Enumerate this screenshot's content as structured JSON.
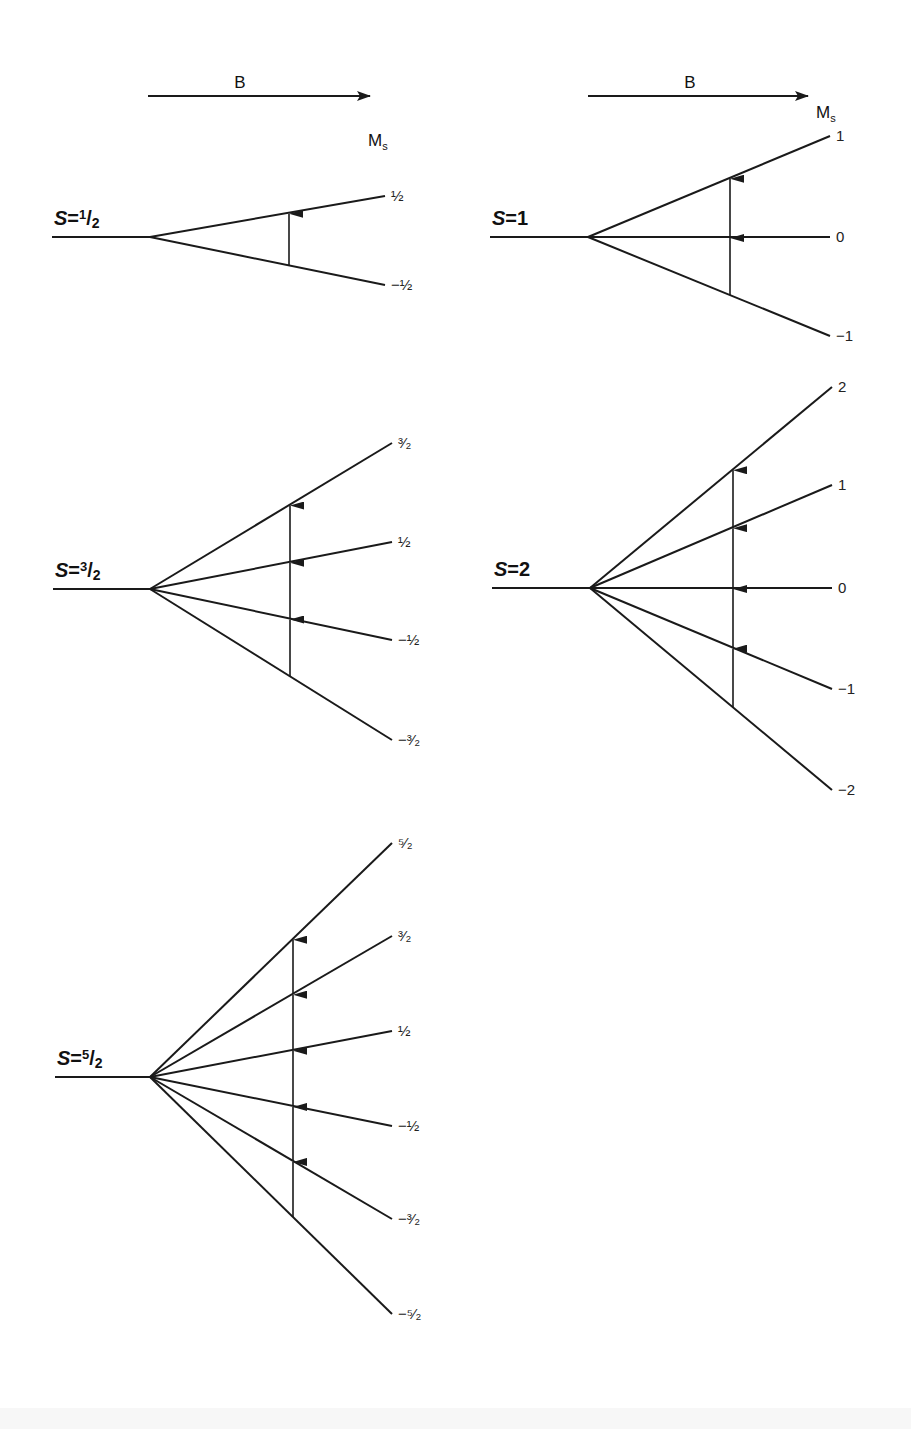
{
  "figure": {
    "field_arrow_label": "B",
    "ms_label": "M",
    "ms_subscript": "s",
    "colors": {
      "ink": "#1a1a1a",
      "background": "#ffffff"
    }
  },
  "panels": [
    {
      "id": "s-half",
      "spin_label": "S=",
      "spin_value": "1/2",
      "spin_sup": "1",
      "spin_sub": "2",
      "base_y": 237,
      "start_x": 52,
      "origin_x": 150,
      "end_x": 385,
      "arrow_x": 289,
      "levels": [
        {
          "ms": "½",
          "end_y": 196
        },
        {
          "ms": "−½",
          "end_y": 285
        }
      ]
    },
    {
      "id": "s-one",
      "spin_label": "S=",
      "spin_value": "1",
      "spin_sup": "",
      "spin_sub": "",
      "base_y": 237,
      "start_x": 490,
      "origin_x": 588,
      "end_x": 830,
      "arrow_x": 730,
      "levels": [
        {
          "ms": "1",
          "end_y": 136
        },
        {
          "ms": "0",
          "end_y": 237
        },
        {
          "ms": "−1",
          "end_y": 336
        }
      ]
    },
    {
      "id": "s-three-halves",
      "spin_label": "S=",
      "spin_value": "3/2",
      "spin_sup": "3",
      "spin_sub": "2",
      "base_y": 589,
      "start_x": 53,
      "origin_x": 150,
      "end_x": 392,
      "arrow_x": 290,
      "levels": [
        {
          "ms": "³⁄₂",
          "end_y": 443
        },
        {
          "ms": "½",
          "end_y": 542
        },
        {
          "ms": "−½",
          "end_y": 640
        },
        {
          "ms": "−³⁄₂",
          "end_y": 740
        }
      ]
    },
    {
      "id": "s-two",
      "spin_label": "S=",
      "spin_value": "2",
      "spin_sup": "",
      "spin_sub": "",
      "base_y": 588,
      "start_x": 492,
      "origin_x": 590,
      "end_x": 832,
      "arrow_x": 733,
      "levels": [
        {
          "ms": "2",
          "end_y": 387
        },
        {
          "ms": "1",
          "end_y": 485
        },
        {
          "ms": "0",
          "end_y": 588
        },
        {
          "ms": "−1",
          "end_y": 689
        },
        {
          "ms": "−2",
          "end_y": 790
        }
      ]
    },
    {
      "id": "s-five-halves",
      "spin_label": "S=",
      "spin_value": "5/2",
      "spin_sup": "5",
      "spin_sub": "2",
      "base_y": 1077,
      "start_x": 55,
      "origin_x": 150,
      "end_x": 392,
      "arrow_x": 293,
      "levels": [
        {
          "ms": "⁵⁄₂",
          "end_y": 843
        },
        {
          "ms": "³⁄₂",
          "end_y": 936
        },
        {
          "ms": "½",
          "end_y": 1031
        },
        {
          "ms": "−½",
          "end_y": 1126
        },
        {
          "ms": "−³⁄₂",
          "end_y": 1219
        },
        {
          "ms": "−⁵⁄₂",
          "end_y": 1314
        }
      ]
    }
  ],
  "field_arrows": [
    {
      "x1": 148,
      "x2": 370,
      "y": 96,
      "label_x": 240,
      "label_y": 88,
      "ms_x": 368,
      "ms_y": 146
    },
    {
      "x1": 588,
      "x2": 808,
      "y": 96,
      "label_x": 690,
      "label_y": 88,
      "ms_x": 816,
      "ms_y": 118
    }
  ]
}
